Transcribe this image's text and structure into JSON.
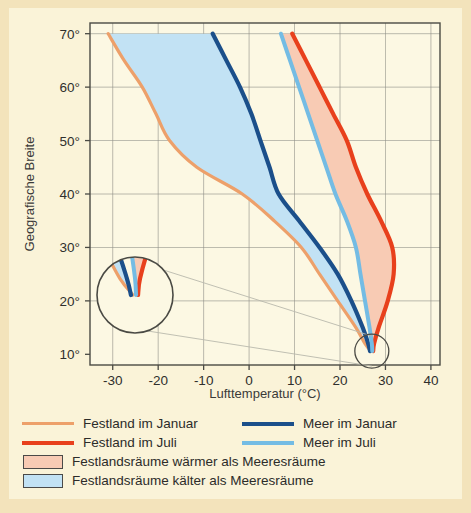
{
  "figure": {
    "background_color": "#f3e3bb",
    "panel_color": "#faf3d8",
    "plot_background": "#fcf8e3"
  },
  "axes": {
    "x": {
      "label": "Lufttemperatur (°C)",
      "ticks": [
        "-30",
        "-20",
        "-10",
        "0",
        "10",
        "20",
        "30",
        "40"
      ],
      "min": -35,
      "max": 42
    },
    "y": {
      "label": "Geografische Breite",
      "ticks": [
        "70°",
        "60°",
        "50°",
        "40°",
        "30°",
        "20°",
        "10°"
      ],
      "min": 8,
      "max": 72
    }
  },
  "colors": {
    "festland_januar": "#eda06a",
    "festland_juli": "#e8401c",
    "meer_januar": "#1b4f8a",
    "meer_juli": "#74bce4",
    "fill_waermer": "#f8cbb4",
    "fill_kaelter": "#c2e2f4",
    "grid": "#8e8e86",
    "frame": "#4a4a44"
  },
  "legend": {
    "items": [
      {
        "label": "Festland im Januar",
        "swatch": "line",
        "color": "#eda06a",
        "width": 3
      },
      {
        "label": "Festland im Juli",
        "swatch": "line",
        "color": "#e8401c",
        "width": 4
      },
      {
        "label": "Meer im Januar",
        "swatch": "line",
        "color": "#1b4f8a",
        "width": 4
      },
      {
        "label": "Meer im Juli",
        "swatch": "line",
        "color": "#74bce4",
        "width": 4
      },
      {
        "label": "Festlandsräume wärmer als Meeresräume",
        "swatch": "box",
        "color": "#f8cbb4"
      },
      {
        "label": "Festlandsräume kälter als Meeresräume",
        "swatch": "box",
        "color": "#c2e2f4"
      }
    ]
  },
  "inset": {
    "name": "magnifier-detail",
    "source_center": [
      27.0,
      10.6
    ],
    "source_radius_px": 17,
    "lens_center_px": [
      135,
      295
    ],
    "lens_radius_px": 38
  },
  "chart_data": {
    "type": "line",
    "title": "",
    "xlabel": "Lufttemperatur (°C)",
    "ylabel": "Geografische Breite",
    "xlim": [
      -35,
      42
    ],
    "ylim": [
      8,
      72
    ],
    "grid": true,
    "legend_position": "below",
    "x_ticks": [
      -30,
      -20,
      -10,
      0,
      10,
      20,
      30,
      40
    ],
    "y_ticks": [
      10,
      20,
      30,
      40,
      50,
      60,
      70
    ],
    "note": "x = air temperature in degrees Celsius; y = latitude in degrees north",
    "series": [
      {
        "name": "Festland im Januar",
        "color": "#eda06a",
        "latitudes": [
          70,
          65,
          60,
          55,
          50,
          45,
          40,
          35,
          30,
          25,
          20,
          15,
          12,
          10.6
        ],
        "values": [
          -31,
          -27.5,
          -23.5,
          -20.5,
          -17.5,
          -11.5,
          -1.5,
          5.5,
          11.5,
          15.5,
          19.5,
          23.5,
          25.5,
          26.8
        ]
      },
      {
        "name": "Festland im Juli",
        "color": "#e8401c",
        "latitudes": [
          70,
          65,
          60,
          55,
          50,
          45,
          40,
          35,
          30,
          25,
          20,
          15,
          12,
          10.6
        ],
        "values": [
          9.5,
          12.5,
          15.5,
          18.5,
          21.5,
          23.5,
          26.0,
          29.0,
          31.5,
          31.8,
          30.5,
          28.5,
          27.5,
          27.3
        ]
      },
      {
        "name": "Meer im Januar",
        "color": "#1b4f8a",
        "latitudes": [
          70,
          65,
          60,
          55,
          50,
          45,
          40,
          35,
          30,
          25,
          20,
          15,
          12,
          10.6
        ],
        "values": [
          -8.0,
          -5.0,
          -2.0,
          0.5,
          2.5,
          4.5,
          6.5,
          11.0,
          15.5,
          19.5,
          22.5,
          25.0,
          26.2,
          26.6
        ]
      },
      {
        "name": "Meer im Juli",
        "color": "#74bce4",
        "latitudes": [
          70,
          65,
          60,
          55,
          50,
          45,
          40,
          35,
          30,
          25,
          20,
          15,
          12,
          10.6
        ],
        "values": [
          7.0,
          9.0,
          11.0,
          13.0,
          15.0,
          17.0,
          19.0,
          21.5,
          23.5,
          24.5,
          25.5,
          26.5,
          27.0,
          27.1
        ]
      }
    ],
    "bands": [
      {
        "name": "Festlandsräume kälter als Meeresräume",
        "color": "#c2e2f4",
        "between": [
          "Festland im Januar",
          "Meer im Januar"
        ]
      },
      {
        "name": "Festlandsräume wärmer als Meeresräume",
        "color": "#f8cbb4",
        "between": [
          "Meer im Juli",
          "Festland im Juli"
        ]
      }
    ]
  }
}
